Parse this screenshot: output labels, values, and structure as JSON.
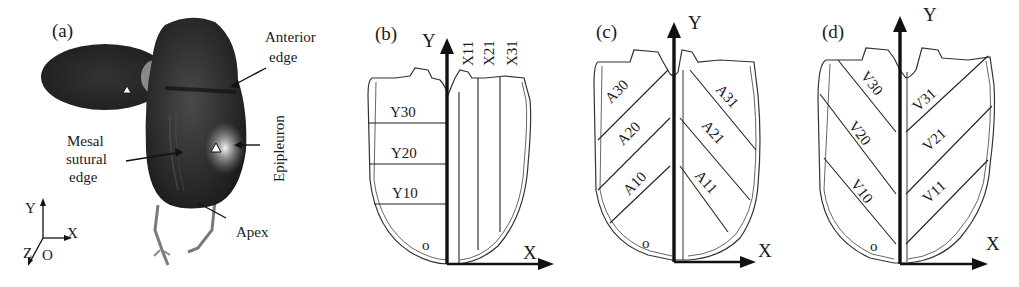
{
  "figure": {
    "panels": [
      {
        "id": "a",
        "label": "(a)",
        "type": "photograph",
        "annotations": {
          "anterior_edge": [
            "Anterior",
            "edge"
          ],
          "epipleuron": "Epipleuron",
          "mesal_sutural_edge": [
            "Mesal",
            "sutural",
            "edge"
          ],
          "apex": "Apex"
        },
        "axes": {
          "y": "Y",
          "x": "X",
          "z": "Z",
          "origin": "O"
        }
      },
      {
        "id": "b",
        "label": "(b)",
        "type": "diagram",
        "axes": {
          "y": "Y",
          "x": "X",
          "origin": "o"
        },
        "left_regions": [
          "Y30",
          "Y20",
          "Y10"
        ],
        "right_regions": [
          "X11",
          "X21",
          "X31"
        ]
      },
      {
        "id": "c",
        "label": "(c)",
        "type": "diagram",
        "axes": {
          "y": "Y",
          "x": "X",
          "origin": "o"
        },
        "left_regions": [
          "A30",
          "A20",
          "A10"
        ],
        "right_regions": [
          "A31",
          "A21",
          "A11"
        ]
      },
      {
        "id": "d",
        "label": "(d)",
        "type": "diagram",
        "axes": {
          "y": "Y",
          "x": "X",
          "origin": "o"
        },
        "left_regions": [
          "V30",
          "V20",
          "V10"
        ],
        "right_regions": [
          "V31",
          "V21",
          "V11"
        ]
      }
    ]
  }
}
